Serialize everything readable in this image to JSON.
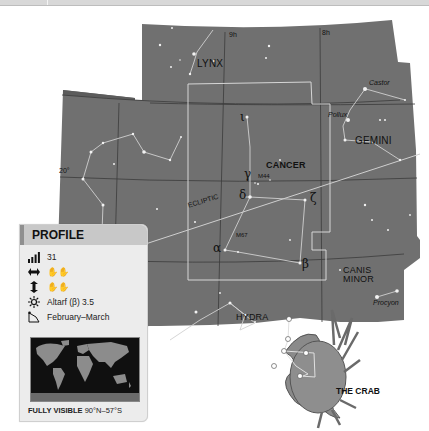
{
  "top_bar": {
    "visible": true
  },
  "star_map": {
    "background_color": "#6e6e6e",
    "boundary_color": "#cfcfcf",
    "grid_color": "#3a3a3a",
    "constellations": [
      {
        "name": "LYNX"
      },
      {
        "name": "CANCER"
      },
      {
        "name": "GEMINI"
      },
      {
        "name": "CANIS\nMINOR",
        "line1": "CANIS",
        "line2": "MINOR"
      },
      {
        "name": "HYDRA"
      }
    ],
    "named_stars": [
      {
        "name": "Castor"
      },
      {
        "name": "Pollux"
      },
      {
        "name": "Procyon"
      }
    ],
    "greek_labels": {
      "gamma": "γ",
      "delta": "δ",
      "zeta": "ζ",
      "alpha": "α",
      "beta": "β",
      "iota": "ι"
    },
    "deep_sky": {
      "m44": "M44",
      "m67": "M67"
    },
    "grid_labels": {
      "ra_9h": "9h",
      "ra_8h": "8h",
      "dec_20": "20°"
    },
    "ecliptic_label": "ECLIPTIC",
    "illustration_caption": "THE CRAB"
  },
  "profile": {
    "title": "PROFILE",
    "size_rank": "31",
    "width_hands": "✋✋",
    "height_hands": "✋✋",
    "brightest_star": "Altarf (β) 3.5",
    "best_seen": "February–March",
    "visibility_label": "FULLY VISIBLE",
    "visibility_range": "90°N–57°S",
    "icons": {
      "size": "signal-bars-icon",
      "width": "horizontal-arrows-icon",
      "height": "vertical-arrows-icon",
      "brightest": "star-sun-icon",
      "season": "calendar-icon"
    }
  }
}
